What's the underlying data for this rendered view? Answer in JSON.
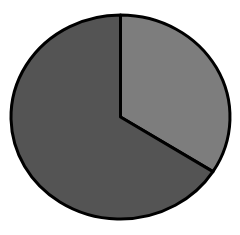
{
  "page": {
    "background_color": "#ffffff"
  },
  "chart_data": {
    "type": "pie",
    "slices": [
      {
        "name": "light-gray-slice",
        "value_pct": 34,
        "color": "#7d7d7d"
      },
      {
        "name": "dark-gray-slice",
        "value_pct": 66,
        "color": "#545454"
      }
    ],
    "start_angle_deg_from_top": 0,
    "direction": "clockwise",
    "outline_color": "#000000",
    "outline_width_px": 3,
    "center": {
      "x": 120.5,
      "y": 117
    },
    "radius": {
      "rx": 109.5,
      "ry": 102
    },
    "title": "",
    "labels_visible": false,
    "legend": false
  }
}
